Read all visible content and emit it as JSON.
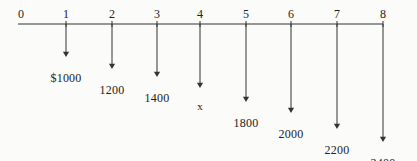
{
  "figure": {
    "type": "cash-flow-diagram",
    "title": "",
    "axis": {
      "label": "",
      "start_period": 0,
      "end_period": 8,
      "tick_labels": [
        "0",
        "1",
        "2",
        "3",
        "4",
        "5",
        "6",
        "7",
        "8"
      ]
    },
    "line_color": "#333333",
    "text_color": "#222222",
    "background_color": "#fbfbf9"
  },
  "chart_data": {
    "type": "bar",
    "title": "",
    "xlabel": "",
    "ylabel": "",
    "categories": [
      "0",
      "1",
      "2",
      "3",
      "4",
      "5",
      "6",
      "7",
      "8"
    ],
    "values": [
      0,
      1000,
      1200,
      1400,
      null,
      1800,
      2000,
      2200,
      2400
    ],
    "value_labels": [
      "",
      "$1000",
      "1200",
      "1400",
      "x",
      "1800",
      "2000",
      "2200",
      "2400"
    ],
    "direction": "downward-arrows",
    "grid": false,
    "legend": "none"
  },
  "flows": [
    {
      "period": "1",
      "label": "$1000",
      "x": 66,
      "tip_y": 57,
      "label_y": 72
    },
    {
      "period": "2",
      "label": "1200",
      "x": 112,
      "tip_y": 69,
      "label_y": 84
    },
    {
      "period": "3",
      "label": "1400",
      "x": 157,
      "tip_y": 77,
      "label_y": 92
    },
    {
      "period": "4",
      "label": "x",
      "x": 200,
      "tip_y": 88,
      "label_y": 101
    },
    {
      "period": "5",
      "label": "1800",
      "x": 246,
      "tip_y": 102,
      "label_y": 117
    },
    {
      "period": "6",
      "label": "2000",
      "x": 291,
      "tip_y": 113,
      "label_y": 128
    },
    {
      "period": "7",
      "label": "2200",
      "x": 337,
      "tip_y": 129,
      "label_y": 144
    },
    {
      "period": "8",
      "label": "2400",
      "x": 383,
      "tip_y": 142,
      "label_y": 157
    }
  ],
  "ticks": [
    {
      "label": "0",
      "x": 21
    },
    {
      "label": "1",
      "x": 66
    },
    {
      "label": "2",
      "x": 112
    },
    {
      "label": "3",
      "x": 157
    },
    {
      "label": "4",
      "x": 200
    },
    {
      "label": "5",
      "x": 246
    },
    {
      "label": "6",
      "x": 291
    },
    {
      "label": "7",
      "x": 337
    },
    {
      "label": "8",
      "x": 383
    }
  ]
}
